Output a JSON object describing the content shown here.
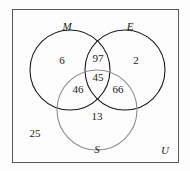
{
  "figure": {
    "type": "venn-diagram-3-set",
    "universe_label": "U",
    "sets": [
      {
        "key": "M",
        "label": "M",
        "label_x": 67,
        "label_y": 26,
        "cx": 70,
        "cy": 70,
        "r": 40,
        "stroke": "#1a1a1a"
      },
      {
        "key": "E",
        "label": "E",
        "label_x": 130,
        "label_y": 26,
        "cx": 125,
        "cy": 70,
        "r": 40,
        "stroke": "#1a1a1a"
      },
      {
        "key": "S",
        "label": "S",
        "label_x": 97,
        "label_y": 149,
        "cx": 97,
        "cy": 110,
        "r": 40,
        "stroke": "#8c8c8c"
      }
    ],
    "regions": [
      {
        "id": "M-only",
        "value": "6",
        "x": 62,
        "y": 60
      },
      {
        "id": "M-and-E",
        "value": "97",
        "x": 98,
        "y": 58
      },
      {
        "id": "E-only",
        "value": "2",
        "x": 136,
        "y": 60
      },
      {
        "id": "M-and-S",
        "value": "46",
        "x": 78,
        "y": 89
      },
      {
        "id": "M-E-and-S",
        "value": "45",
        "x": 98,
        "y": 77
      },
      {
        "id": "E-and-S",
        "value": "66",
        "x": 118,
        "y": 89
      },
      {
        "id": "S-only",
        "value": "13",
        "x": 97,
        "y": 116
      },
      {
        "id": "outside-all",
        "value": "25",
        "x": 35,
        "y": 133
      }
    ],
    "frame": {
      "x": 12,
      "y": 9,
      "width": 166,
      "height": 153,
      "stroke": "#5a5a5a"
    },
    "universe_label_x": 165,
    "universe_label_y": 150,
    "colors": {
      "background": "#fdfdfd",
      "frame_stroke": "#5a5a5a",
      "circle_stroke_dark": "#1a1a1a",
      "circle_stroke_light": "#8c8c8c",
      "text": "#1a1a1a"
    }
  },
  "chart_data": {
    "type": "table",
    "categories": [
      "M only",
      "M and E only",
      "E only",
      "M and S only",
      "M and E and S",
      "E and S only",
      "S only",
      "Outside all sets"
    ],
    "values": [
      6,
      97,
      2,
      46,
      45,
      66,
      13,
      25
    ],
    "set_labels": [
      "M",
      "E",
      "S"
    ],
    "universe_label": "U",
    "xlabel": "",
    "ylabel": ""
  }
}
